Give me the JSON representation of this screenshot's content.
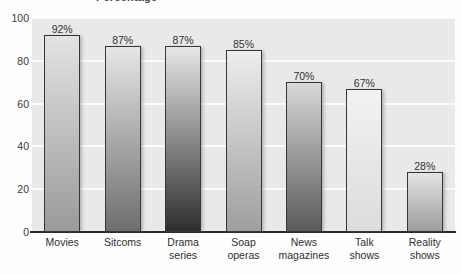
{
  "chart_data": {
    "type": "bar",
    "title": "Percentage",
    "title_cropped": true,
    "xlabel": "",
    "ylabel": "",
    "ylim": [
      0,
      100
    ],
    "yticks": [
      0,
      20,
      40,
      60,
      80,
      100
    ],
    "ytick_labels": [
      "0",
      "20",
      "40",
      "60",
      "80",
      "100"
    ],
    "grid": true,
    "legend": "none",
    "categories": [
      "Movies",
      "Sitcoms",
      "Drama series",
      "Soap operas",
      "News magazines",
      "Talk shows",
      "Reality shows"
    ],
    "category_lines": [
      [
        "Movies"
      ],
      [
        "Sitcoms"
      ],
      [
        "Drama",
        "series"
      ],
      [
        "Soap",
        "operas"
      ],
      [
        "News",
        "magazines"
      ],
      [
        "Talk",
        "shows"
      ],
      [
        "Reality",
        "shows"
      ]
    ],
    "values": [
      92,
      87,
      87,
      85,
      70,
      67,
      28
    ],
    "data_labels": [
      "92%",
      "87%",
      "87%",
      "85%",
      "70%",
      "67%",
      "28%"
    ],
    "bar_colors_top": [
      "#e3e3e3",
      "#e6e6e6",
      "#e6e6e6",
      "#ededed",
      "#d8d8d8",
      "#f2f2f2",
      "#e4e4e4"
    ],
    "bar_colors_bottom": [
      "#9a9a9a",
      "#6e6e6e",
      "#2e2e2e",
      "#9e9e9e",
      "#5a5a5a",
      "#dcdcdc",
      "#9c9c9c"
    ],
    "plot_background": "#e9e9e9",
    "gridline_color": "#fbfbfb",
    "axis_color": "#2b2b2b",
    "outline_color": "#35353a"
  }
}
